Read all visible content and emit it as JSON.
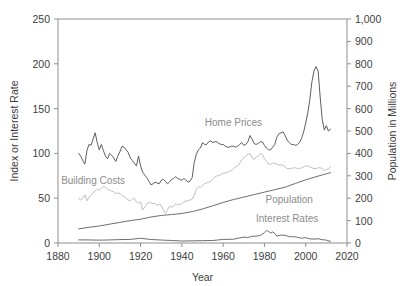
{
  "chart_data": {
    "type": "line",
    "title": "",
    "xlabel": "Year",
    "ylabel": "Index or Interest Rate",
    "y2label": "Population in Millions",
    "xlim": [
      1880,
      2020
    ],
    "ylim": [
      0,
      250
    ],
    "y2lim": [
      0,
      1000
    ],
    "grid": false,
    "legend": "inline-annotations",
    "xticks": [
      "1880",
      "1900",
      "1920",
      "1940",
      "1960",
      "1980",
      "2000",
      "2020"
    ],
    "xtick_values": [
      1880,
      1900,
      1920,
      1940,
      1960,
      1980,
      2000,
      2020
    ],
    "yticks": [
      "0",
      "50",
      "100",
      "150",
      "200",
      "250"
    ],
    "ytick_values": [
      0,
      50,
      100,
      150,
      200,
      250
    ],
    "y2ticks": [
      "0",
      "100",
      "200",
      "300",
      "400",
      "500",
      "600",
      "700",
      "800",
      "900",
      "1,000"
    ],
    "y2tick_values": [
      0,
      100,
      200,
      300,
      400,
      500,
      600,
      700,
      800,
      900,
      1000
    ],
    "annotations": [
      {
        "text": "Home Prices",
        "x": 1965,
        "y": 131,
        "color": "#8c8c8c"
      },
      {
        "text": "Building Costs",
        "x": 1897,
        "y": 66,
        "color": "#b4b4b4"
      },
      {
        "text": "Population",
        "x": 1992,
        "y": 45,
        "color": "#8c8c8c"
      },
      {
        "text": "Interest Rates",
        "x": 1991,
        "y": 23,
        "color": "#8c8c8c"
      }
    ],
    "series": [
      {
        "name": "Home Prices",
        "axis": "left",
        "color": "#5e5e5e",
        "x": [
          1890,
          1891,
          1892,
          1893,
          1894,
          1895,
          1896,
          1897,
          1898,
          1899,
          1900,
          1901,
          1902,
          1903,
          1904,
          1905,
          1906,
          1907,
          1908,
          1909,
          1910,
          1911,
          1912,
          1913,
          1914,
          1915,
          1916,
          1917,
          1918,
          1919,
          1920,
          1921,
          1922,
          1923,
          1924,
          1925,
          1926,
          1927,
          1928,
          1929,
          1930,
          1931,
          1932,
          1933,
          1934,
          1935,
          1936,
          1937,
          1938,
          1939,
          1940,
          1941,
          1942,
          1943,
          1944,
          1945,
          1946,
          1947,
          1948,
          1949,
          1950,
          1951,
          1952,
          1953,
          1954,
          1955,
          1956,
          1957,
          1958,
          1959,
          1960,
          1961,
          1962,
          1963,
          1964,
          1965,
          1966,
          1967,
          1968,
          1969,
          1970,
          1971,
          1972,
          1973,
          1974,
          1975,
          1976,
          1977,
          1978,
          1979,
          1980,
          1981,
          1982,
          1983,
          1984,
          1985,
          1986,
          1987,
          1988,
          1989,
          1990,
          1991,
          1992,
          1993,
          1994,
          1995,
          1996,
          1997,
          1998,
          1999,
          2000,
          2001,
          2002,
          2003,
          2004,
          2005,
          2006,
          2007,
          2008,
          2009,
          2010,
          2011,
          2012
        ],
        "values": [
          100,
          97,
          92,
          88,
          103,
          110,
          109,
          116,
          123,
          112,
          104,
          110,
          103,
          97,
          94,
          100,
          98,
          95,
          91,
          97,
          102,
          108,
          107,
          104,
          101,
          95,
          92,
          89,
          86,
          97,
          86,
          79,
          76,
          73,
          69,
          65,
          66,
          68,
          67,
          66,
          70,
          71,
          69,
          66,
          68,
          71,
          72,
          74,
          72,
          71,
          70,
          72,
          70,
          68,
          69,
          73,
          90,
          99,
          104,
          106,
          112,
          110,
          110,
          113,
          114,
          112,
          113,
          113,
          111,
          110,
          110,
          108,
          107,
          107,
          108,
          108,
          107,
          108,
          110,
          112,
          109,
          110,
          113,
          120,
          116,
          111,
          110,
          111,
          113,
          113,
          109,
          106,
          104,
          104,
          107,
          110,
          118,
          122,
          123,
          124,
          120,
          115,
          112,
          110,
          110,
          109,
          110,
          112,
          117,
          124,
          134,
          145,
          160,
          180,
          192,
          197,
          192,
          163,
          138,
          126,
          131,
          125,
          127
        ],
        "peak": {
          "year": 2006,
          "value": 197
        }
      },
      {
        "name": "Building Costs",
        "axis": "left",
        "color": "#c0c0c0",
        "x": [
          1890,
          1891,
          1892,
          1893,
          1894,
          1895,
          1896,
          1897,
          1898,
          1899,
          1900,
          1901,
          1902,
          1903,
          1904,
          1905,
          1906,
          1907,
          1908,
          1909,
          1910,
          1911,
          1912,
          1913,
          1914,
          1915,
          1916,
          1917,
          1918,
          1919,
          1920,
          1921,
          1922,
          1923,
          1924,
          1925,
          1926,
          1927,
          1928,
          1929,
          1930,
          1931,
          1932,
          1933,
          1934,
          1935,
          1936,
          1937,
          1938,
          1939,
          1940,
          1941,
          1942,
          1943,
          1944,
          1945,
          1946,
          1947,
          1948,
          1949,
          1950,
          1951,
          1952,
          1953,
          1954,
          1955,
          1956,
          1957,
          1958,
          1959,
          1960,
          1961,
          1962,
          1963,
          1964,
          1965,
          1966,
          1967,
          1968,
          1969,
          1970,
          1971,
          1972,
          1973,
          1974,
          1975,
          1976,
          1977,
          1978,
          1979,
          1980,
          1981,
          1982,
          1983,
          1984,
          1985,
          1986,
          1987,
          1988,
          1989,
          1990,
          1991,
          1992,
          1993,
          1994,
          1995,
          1996,
          1997,
          1998,
          1999,
          2000,
          2001,
          2002,
          2003,
          2004,
          2005,
          2006,
          2007,
          2008,
          2009,
          2010,
          2011,
          2012
        ],
        "values": [
          50,
          48,
          50,
          54,
          47,
          51,
          53,
          56,
          58,
          60,
          59,
          61,
          63,
          62,
          60,
          59,
          58,
          57,
          55,
          56,
          55,
          53,
          52,
          50,
          48,
          47,
          49,
          50,
          46,
          44,
          46,
          37,
          40,
          44,
          45,
          45,
          44,
          44,
          42,
          43,
          42,
          37,
          33,
          37,
          41,
          40,
          41,
          44,
          43,
          43,
          44,
          46,
          47,
          47,
          48,
          49,
          53,
          60,
          63,
          62,
          64,
          66,
          67,
          68,
          69,
          71,
          74,
          75,
          75,
          77,
          78,
          78,
          79,
          80,
          81,
          83,
          85,
          86,
          89,
          93,
          95,
          97,
          99,
          100,
          95,
          93,
          96,
          97,
          100,
          99,
          94,
          91,
          88,
          88,
          89,
          89,
          88,
          87,
          87,
          87,
          85,
          83,
          83,
          83,
          84,
          84,
          83,
          83,
          84,
          85,
          86,
          86,
          85,
          84,
          83,
          83,
          84,
          84,
          83,
          81,
          82,
          83,
          85
        ],
        "peak": {
          "year": 1978,
          "value": 100
        }
      },
      {
        "name": "Population",
        "axis": "right",
        "color": "#6e6e6e",
        "x": [
          1890,
          1895,
          1900,
          1905,
          1910,
          1915,
          1920,
          1925,
          1930,
          1935,
          1940,
          1945,
          1950,
          1955,
          1960,
          1965,
          1970,
          1975,
          1980,
          1985,
          1990,
          1995,
          2000,
          2005,
          2010,
          2012
        ],
        "values": [
          63,
          70,
          76,
          84,
          92,
          100,
          106,
          116,
          123,
          127,
          132,
          140,
          152,
          166,
          181,
          194,
          205,
          216,
          227,
          238,
          249,
          266,
          282,
          296,
          309,
          314
        ],
        "units": "millions"
      },
      {
        "name": "Interest Rates",
        "axis": "left",
        "color": "#6e6e6e",
        "x": [
          1890,
          1895,
          1900,
          1905,
          1910,
          1915,
          1920,
          1925,
          1930,
          1935,
          1940,
          1945,
          1950,
          1955,
          1960,
          1965,
          1970,
          1972,
          1974,
          1976,
          1978,
          1980,
          1981,
          1982,
          1983,
          1984,
          1985,
          1986,
          1987,
          1988,
          1990,
          1992,
          1994,
          1996,
          1998,
          2000,
          2002,
          2004,
          2006,
          2008,
          2010,
          2012
        ],
        "values": [
          3.5,
          3.4,
          3.2,
          3.4,
          3.8,
          4.0,
          5.3,
          3.9,
          3.3,
          2.8,
          2.2,
          2.4,
          2.6,
          2.8,
          4.0,
          4.2,
          6.6,
          6.1,
          7.6,
          7.6,
          8.4,
          11.5,
          13.9,
          13.0,
          11.1,
          12.4,
          10.6,
          7.7,
          8.4,
          8.8,
          8.6,
          7.0,
          7.1,
          6.4,
          5.3,
          6.0,
          4.6,
          4.3,
          4.8,
          3.7,
          3.2,
          1.8
        ],
        "peak": {
          "year": 1981,
          "value": 13.9
        }
      }
    ]
  }
}
